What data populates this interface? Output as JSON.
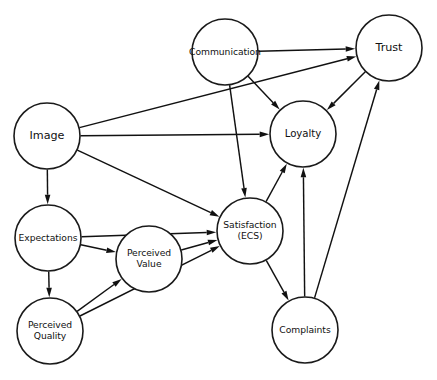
{
  "diagram": {
    "type": "directed-graph",
    "background_color": "#ffffff",
    "node_fill": "#ffffff",
    "node_stroke": "#1a1a1a",
    "edge_color": "#111111",
    "nodes": [
      {
        "id": "communication",
        "label": "Communication",
        "lines": [
          "Communication"
        ],
        "cx": 225,
        "cy": 52,
        "r": 33,
        "font": "small"
      },
      {
        "id": "trust",
        "label": "Trust",
        "lines": [
          "Trust"
        ],
        "cx": 389,
        "cy": 48,
        "r": 33,
        "font": "big"
      },
      {
        "id": "image",
        "label": "Image",
        "lines": [
          "Image"
        ],
        "cx": 47,
        "cy": 136,
        "r": 33,
        "font": "big"
      },
      {
        "id": "loyalty",
        "label": "Loyalty",
        "lines": [
          "Loyalty"
        ],
        "cx": 303,
        "cy": 134,
        "r": 33,
        "font": "med"
      },
      {
        "id": "expectations",
        "label": "Expectations",
        "lines": [
          "Expectations"
        ],
        "cx": 48,
        "cy": 238,
        "r": 33,
        "font": "small"
      },
      {
        "id": "satisfaction",
        "label": "Satisfaction (ECS)",
        "lines": [
          "Satisfaction",
          "(ECS)"
        ],
        "cx": 250,
        "cy": 231,
        "r": 33,
        "font": "small"
      },
      {
        "id": "perceived_value",
        "label": "Perceived Value",
        "lines": [
          "Perceived",
          "Value"
        ],
        "cx": 149,
        "cy": 259,
        "r": 33,
        "font": "small"
      },
      {
        "id": "perceived_quality",
        "label": "Perceived Quality",
        "lines": [
          "Perceived",
          "Quality"
        ],
        "cx": 50,
        "cy": 331,
        "r": 33,
        "font": "small"
      },
      {
        "id": "complaints",
        "label": "Complaints",
        "lines": [
          "Complaints"
        ],
        "cx": 305,
        "cy": 330,
        "r": 33,
        "font": "small"
      }
    ],
    "edges": [
      {
        "id": "communication-trust",
        "from": "communication",
        "to": "trust"
      },
      {
        "id": "communication-loyalty",
        "from": "communication",
        "to": "loyalty"
      },
      {
        "id": "communication-satisfaction",
        "from": "communication",
        "to": "satisfaction"
      },
      {
        "id": "image-trust",
        "from": "image",
        "to": "trust"
      },
      {
        "id": "image-loyalty",
        "from": "image",
        "to": "loyalty"
      },
      {
        "id": "image-satisfaction",
        "from": "image",
        "to": "satisfaction"
      },
      {
        "id": "image-expectations",
        "from": "image",
        "to": "expectations"
      },
      {
        "id": "trust-loyalty",
        "from": "trust",
        "to": "loyalty"
      },
      {
        "id": "expectations-satisfaction",
        "from": "expectations",
        "to": "satisfaction"
      },
      {
        "id": "expectations-value",
        "from": "expectations",
        "to": "perceived_value"
      },
      {
        "id": "expectations-quality",
        "from": "expectations",
        "to": "perceived_quality"
      },
      {
        "id": "quality-value",
        "from": "perceived_quality",
        "to": "perceived_value"
      },
      {
        "id": "quality-satisfaction",
        "from": "perceived_quality",
        "to": "satisfaction"
      },
      {
        "id": "value-satisfaction",
        "from": "perceived_value",
        "to": "satisfaction"
      },
      {
        "id": "satisfaction-loyalty",
        "from": "satisfaction",
        "to": "loyalty"
      },
      {
        "id": "satisfaction-complaints",
        "from": "satisfaction",
        "to": "complaints"
      },
      {
        "id": "complaints-loyalty",
        "from": "complaints",
        "to": "loyalty"
      },
      {
        "id": "complaints-trust",
        "from": "complaints",
        "to": "trust"
      }
    ]
  }
}
